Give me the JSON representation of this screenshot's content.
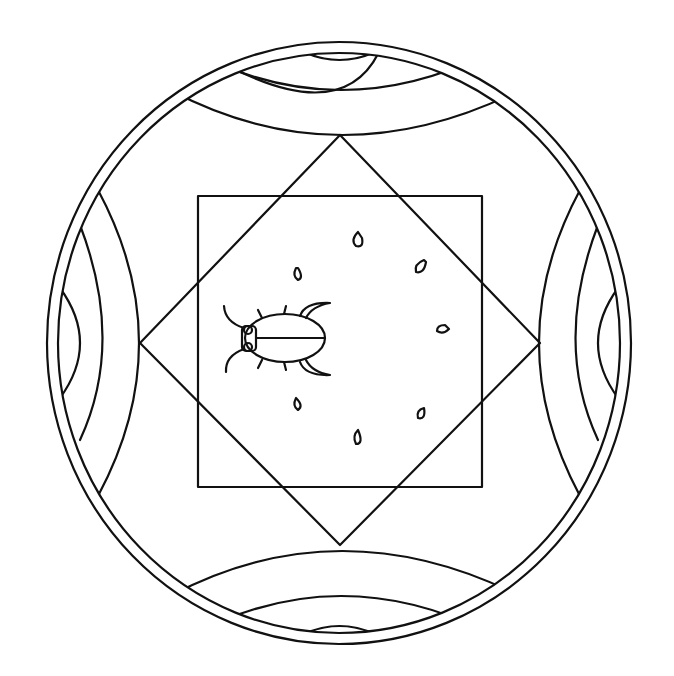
{
  "image": {
    "description": "Mandala coloring page with a beetle",
    "background_color": "#ffffff",
    "line_color": "#111111"
  },
  "elements": {
    "outer_ring": "double ellipse border",
    "arc_bands": [
      "top",
      "bottom",
      "left",
      "right"
    ],
    "diamond": "rotated square",
    "square": "inner square",
    "beetle": "beetle drawing",
    "petals": 7
  }
}
